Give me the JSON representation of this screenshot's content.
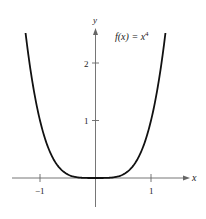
{
  "chart_data": {
    "type": "line",
    "title": "",
    "annotation": "f(x) = x^4",
    "function": "x^4",
    "xlabel": "x",
    "ylabel": "y",
    "xlim": [
      -1.6,
      1.9
    ],
    "ylim": [
      -0.6,
      2.6
    ],
    "x_ticks": [
      -1,
      1
    ],
    "y_ticks": [
      1,
      2
    ],
    "x_tick_labels": [
      "−1",
      "1"
    ],
    "y_tick_labels": [
      "1",
      "2"
    ],
    "grid": false,
    "legend": null,
    "series": [
      {
        "name": "f(x) = x^4",
        "x": [
          -1.25,
          -1.0,
          -0.75,
          -0.5,
          -0.25,
          0,
          0.25,
          0.5,
          0.75,
          1.0,
          1.25
        ],
        "values": [
          2.44,
          1.0,
          0.32,
          0.06,
          0.0,
          0,
          0.0,
          0.06,
          0.32,
          1.0,
          2.44
        ]
      }
    ]
  },
  "labels": {
    "x_axis": "x",
    "y_axis": "y",
    "func_prefix": "f(x) = x",
    "func_exp": "4",
    "xtick_neg1": "−1",
    "xtick_1": "1",
    "ytick_1": "1",
    "ytick_2": "2"
  },
  "colors": {
    "curve": "#111111",
    "axes": "#555555"
  }
}
